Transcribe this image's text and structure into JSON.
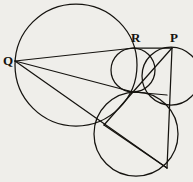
{
  "figure": {
    "caption": "",
    "background_color": "#efeeea",
    "stroke_color": "#15130f",
    "canvas": {
      "width": 193,
      "height": 182
    },
    "labels": [
      {
        "id": "label-q",
        "text": "Q",
        "x": 3,
        "y": 54
      },
      {
        "id": "label-r",
        "text": "R",
        "x": 131,
        "y": 31
      },
      {
        "id": "label-p",
        "text": "P",
        "x": 170,
        "y": 31
      }
    ],
    "points": [
      {
        "id": "point-q",
        "name": "Q",
        "x": 15,
        "y": 61
      },
      {
        "id": "point-r",
        "name": "R",
        "x": 134,
        "y": 48
      },
      {
        "id": "point-p",
        "name": "P",
        "x": 172,
        "y": 48
      },
      {
        "id": "point-center",
        "name": "central-intersection",
        "x": 133,
        "y": 92
      },
      {
        "id": "point-lower-left",
        "name": "lower-left-intersection",
        "x": 104,
        "y": 125
      },
      {
        "id": "point-lower-right",
        "name": "lower-right-intersection",
        "x": 167,
        "y": 168
      },
      {
        "id": "point-right-mid",
        "name": "right-circle-lower",
        "x": 167,
        "y": 95
      }
    ],
    "circles": [
      {
        "id": "circle-large",
        "name": "large-circle",
        "cx": 76,
        "cy": 65,
        "r": 61
      },
      {
        "id": "circle-upper",
        "name": "upper-right-circle",
        "cx": 133,
        "cy": 70,
        "r": 22
      },
      {
        "id": "circle-right",
        "name": "right-circle",
        "cx": 171,
        "cy": 76,
        "r": 29
      },
      {
        "id": "circle-lower",
        "name": "lower-circle",
        "cx": 136,
        "cy": 134,
        "r": 42
      }
    ],
    "lines": [
      {
        "id": "line-q-r",
        "name": "chord-q-to-r",
        "x1": 15,
        "y1": 61,
        "x2": 134,
        "y2": 48
      },
      {
        "id": "line-q-center",
        "name": "chord-q-to-center",
        "x1": 15,
        "y1": 61,
        "x2": 133,
        "y2": 92
      },
      {
        "id": "line-q-lower",
        "name": "chord-q-to-lower",
        "x1": 15,
        "y1": 61,
        "x2": 167,
        "y2": 168
      },
      {
        "id": "line-r-p",
        "name": "segment-r-to-p",
        "x1": 134,
        "y1": 48,
        "x2": 172,
        "y2": 48
      },
      {
        "id": "line-p-center",
        "name": "segment-p-to-center",
        "x1": 172,
        "y1": 48,
        "x2": 133,
        "y2": 92
      },
      {
        "id": "line-p-vertical",
        "name": "segment-p-vertical",
        "x1": 172,
        "y1": 48,
        "x2": 167,
        "y2": 168
      },
      {
        "id": "line-center-right",
        "name": "segment-center-to-right",
        "x1": 133,
        "y1": 92,
        "x2": 167,
        "y2": 95
      },
      {
        "id": "line-lower-diag",
        "name": "segment-lower-diagonal",
        "x1": 104,
        "y1": 125,
        "x2": 167,
        "y2": 168
      },
      {
        "id": "line-center-lower",
        "name": "segment-center-to-lower",
        "x1": 133,
        "y1": 92,
        "x2": 104,
        "y2": 125
      }
    ]
  }
}
